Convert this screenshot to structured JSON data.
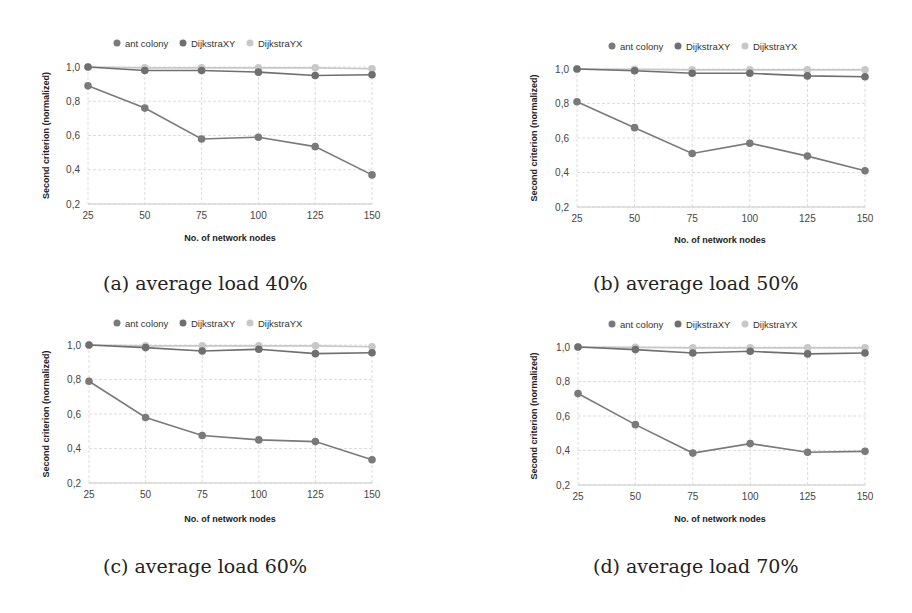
{
  "colors": {
    "ant_colony": "#7a7a7a",
    "DijkstraXY": "#6f6f6f",
    "DijkstraYX": "#c8c8c8",
    "grid": "#dddddd",
    "axis": "#cccccc"
  },
  "legend": [
    "ant colony",
    "DijkstraXY",
    "DijkstraYX"
  ],
  "captions": [
    "(a) average load 40%",
    "(b) average load 50%",
    "(c) average load 60%",
    "(d) average load 70%"
  ],
  "chart_data": [
    {
      "type": "line",
      "title": "(a) average load 40%",
      "xlabel": "No. of network nodes",
      "ylabel": "Second criterion (normalized)",
      "categories": [
        "25",
        "50",
        "75",
        "100",
        "125",
        "150"
      ],
      "yticks": [
        "0,2",
        "0,4",
        "0,6",
        "0,8",
        "1,0"
      ],
      "ylim": [
        0.2,
        1.0
      ],
      "grid": true,
      "legend_position": "top",
      "series": [
        {
          "name": "ant colony",
          "values": [
            0.89,
            0.76,
            0.58,
            0.59,
            0.535,
            0.37
          ]
        },
        {
          "name": "DijkstraXY",
          "values": [
            1.0,
            0.98,
            0.98,
            0.97,
            0.95,
            0.955
          ]
        },
        {
          "name": "DijkstraYX",
          "values": [
            1.0,
            0.995,
            0.995,
            0.995,
            0.995,
            0.99
          ]
        }
      ]
    },
    {
      "type": "line",
      "title": "(b) average load 50%",
      "xlabel": "No. of network nodes",
      "ylabel": "Second criterion (normalized)",
      "categories": [
        "25",
        "50",
        "75",
        "100",
        "125",
        "150"
      ],
      "yticks": [
        "0,2",
        "0,4",
        "0,6",
        "0,8",
        "1,0"
      ],
      "ylim": [
        0.2,
        1.0
      ],
      "grid": true,
      "legend_position": "top",
      "series": [
        {
          "name": "ant colony",
          "values": [
            0.81,
            0.66,
            0.51,
            0.57,
            0.495,
            0.41
          ]
        },
        {
          "name": "DijkstraXY",
          "values": [
            1.0,
            0.99,
            0.975,
            0.975,
            0.96,
            0.955
          ]
        },
        {
          "name": "DijkstraYX",
          "values": [
            1.0,
            0.998,
            0.995,
            0.995,
            0.995,
            0.995
          ]
        }
      ]
    },
    {
      "type": "line",
      "title": "(c) average load 60%",
      "xlabel": "No. of network nodes",
      "ylabel": "Second criterion (normalized)",
      "categories": [
        "25",
        "50",
        "75",
        "100",
        "125",
        "150"
      ],
      "yticks": [
        "0,2",
        "0,4",
        "0,6",
        "0,8",
        "1,0"
      ],
      "ylim": [
        0.2,
        1.0
      ],
      "grid": true,
      "legend_position": "top",
      "series": [
        {
          "name": "ant colony",
          "values": [
            0.79,
            0.58,
            0.475,
            0.45,
            0.44,
            0.335
          ]
        },
        {
          "name": "DijkstraXY",
          "values": [
            1.0,
            0.985,
            0.965,
            0.975,
            0.95,
            0.955
          ]
        },
        {
          "name": "DijkstraYX",
          "values": [
            1.0,
            0.995,
            0.995,
            0.995,
            0.995,
            0.99
          ]
        }
      ]
    },
    {
      "type": "line",
      "title": "(d) average load 70%",
      "xlabel": "No. of network nodes",
      "ylabel": "Second criterion (normalized)",
      "categories": [
        "25",
        "50",
        "75",
        "100",
        "125",
        "150"
      ],
      "yticks": [
        "0,2",
        "0,4",
        "0,6",
        "0,8",
        "1,0"
      ],
      "ylim": [
        0.2,
        1.0
      ],
      "grid": true,
      "legend_position": "top",
      "series": [
        {
          "name": "ant colony",
          "values": [
            0.73,
            0.55,
            0.385,
            0.44,
            0.39,
            0.395
          ]
        },
        {
          "name": "DijkstraXY",
          "values": [
            1.0,
            0.985,
            0.965,
            0.975,
            0.96,
            0.965
          ]
        },
        {
          "name": "DijkstraYX",
          "values": [
            1.0,
            0.998,
            0.995,
            0.995,
            0.995,
            0.995
          ]
        }
      ]
    }
  ]
}
